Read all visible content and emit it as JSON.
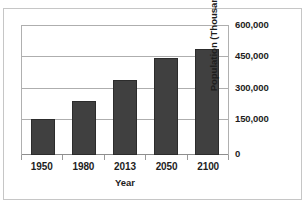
{
  "top_sliver_text": "",
  "chart_data": {
    "type": "bar",
    "title": "",
    "xlabel": "Year",
    "ylabel": "Population (Thousands)",
    "categories": [
      "1950",
      "1980",
      "2013",
      "2050",
      "2100"
    ],
    "values": [
      165000,
      248000,
      347000,
      450000,
      490000
    ],
    "ylim": [
      0,
      600000
    ],
    "yticks": [
      0,
      150000,
      300000,
      450000,
      600000
    ],
    "ytick_labels": [
      "0",
      "150,000",
      "300,000",
      "450,000",
      "600,000"
    ],
    "grid": true,
    "legend": "none",
    "y_axis_position": "right",
    "bar_color": "#404040",
    "gridline_color": "#aeaeae",
    "background_color": "#ffffff",
    "frame_color": "#c6c6c6"
  }
}
